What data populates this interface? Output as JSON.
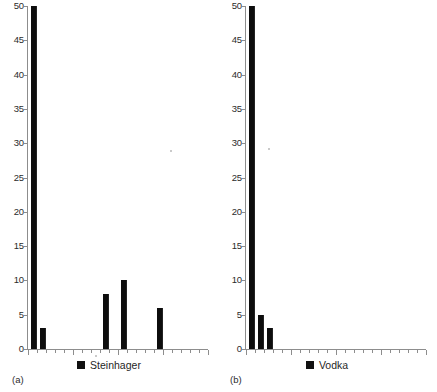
{
  "figure": {
    "background_color": "#ffffff",
    "bar_color": "#0d0d0d",
    "axis_color": "#8d8d8d"
  },
  "panels": [
    {
      "tag": "(a)",
      "legend_label": "Steinhager",
      "legend_swatch": "square-marker",
      "ylabels": [
        "0",
        "5",
        "10",
        "15",
        "20",
        "25",
        "30",
        "35",
        "40",
        "45",
        "50"
      ]
    },
    {
      "tag": "(b)",
      "legend_label": "Vodka",
      "legend_swatch": "square-marker",
      "ylabels": [
        "0",
        "5",
        "10",
        "15",
        "20",
        "25",
        "30",
        "35",
        "40",
        "45",
        "50"
      ]
    }
  ],
  "chart_data": [
    {
      "type": "bar",
      "title": "",
      "subtitle": "",
      "panel": "(a)",
      "xlabel": "",
      "ylabel": "",
      "ylim": [
        0,
        50
      ],
      "ytick_step": 5,
      "yticks": [
        0,
        5,
        10,
        15,
        20,
        25,
        30,
        35,
        40,
        45,
        50
      ],
      "grid": false,
      "legend": [
        "Steinhager"
      ],
      "legend_position": "bottom-center",
      "x_tick_count": 20,
      "x_tick_labels": [],
      "categories": [
        1,
        2,
        3,
        4,
        5,
        6,
        7,
        8,
        9,
        10,
        11,
        12,
        13,
        14,
        15,
        16,
        17,
        18,
        19,
        20
      ],
      "series": [
        {
          "name": "Steinhager",
          "values": [
            50,
            3,
            0,
            0,
            0,
            0,
            0,
            0,
            8,
            0,
            10,
            0,
            0,
            0,
            6,
            0,
            0,
            0,
            0,
            0
          ]
        }
      ],
      "nonzero_points": [
        {
          "x": 1,
          "y": 50
        },
        {
          "x": 2,
          "y": 3
        },
        {
          "x": 9,
          "y": 8
        },
        {
          "x": 11,
          "y": 10
        },
        {
          "x": 15,
          "y": 6
        }
      ]
    },
    {
      "type": "bar",
      "title": "",
      "subtitle": "",
      "panel": "(b)",
      "xlabel": "",
      "ylabel": "",
      "ylim": [
        0,
        50
      ],
      "ytick_step": 5,
      "yticks": [
        0,
        5,
        10,
        15,
        20,
        25,
        30,
        35,
        40,
        45,
        50
      ],
      "grid": false,
      "legend": [
        "Vodka"
      ],
      "legend_position": "bottom-center",
      "x_tick_count": 20,
      "x_tick_labels": [],
      "categories": [
        1,
        2,
        3,
        4,
        5,
        6,
        7,
        8,
        9,
        10,
        11,
        12,
        13,
        14,
        15,
        16,
        17,
        18,
        19,
        20
      ],
      "series": [
        {
          "name": "Vodka",
          "values": [
            50,
            5,
            3,
            0,
            0,
            0,
            0,
            0,
            0,
            0,
            0,
            0,
            0,
            0,
            0,
            0,
            0,
            0,
            0,
            0
          ]
        }
      ],
      "nonzero_points": [
        {
          "x": 1,
          "y": 50
        },
        {
          "x": 2,
          "y": 5
        },
        {
          "x": 3,
          "y": 3
        }
      ]
    }
  ]
}
